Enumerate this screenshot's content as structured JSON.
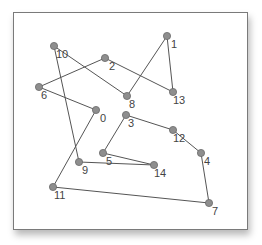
{
  "diagram": {
    "type": "graph-tour",
    "node_color": "#8e8e8e",
    "edge_color": "#555555",
    "label_color": "#444444",
    "nodes": [
      {
        "id": "0",
        "label": "0",
        "x": 96,
        "y": 110,
        "lx": 4,
        "ly": 12
      },
      {
        "id": "1",
        "label": "1",
        "x": 167,
        "y": 36,
        "lx": 4,
        "ly": 12
      },
      {
        "id": "2",
        "label": "2",
        "x": 105,
        "y": 58,
        "lx": 4,
        "ly": 12
      },
      {
        "id": "3",
        "label": "3",
        "x": 126,
        "y": 115,
        "lx": 2,
        "ly": 12
      },
      {
        "id": "4",
        "label": "4",
        "x": 201,
        "y": 153,
        "lx": 3,
        "ly": 12
      },
      {
        "id": "5",
        "label": "5",
        "x": 103,
        "y": 153,
        "lx": 3,
        "ly": 12
      },
      {
        "id": "6",
        "label": "6",
        "x": 39,
        "y": 87,
        "lx": 2,
        "ly": 12
      },
      {
        "id": "7",
        "label": "7",
        "x": 209,
        "y": 203,
        "lx": 3,
        "ly": 12
      },
      {
        "id": "8",
        "label": "8",
        "x": 127,
        "y": 96,
        "lx": 2,
        "ly": 12
      },
      {
        "id": "9",
        "label": "9",
        "x": 79,
        "y": 162,
        "lx": 3,
        "ly": 12
      },
      {
        "id": "10",
        "label": "10",
        "x": 54,
        "y": 46,
        "lx": 2,
        "ly": 12
      },
      {
        "id": "11",
        "label": "11",
        "x": 53,
        "y": 187,
        "lx": 1,
        "ly": 12
      },
      {
        "id": "12",
        "label": "12",
        "x": 173,
        "y": 130,
        "lx": 0,
        "ly": 12
      },
      {
        "id": "13",
        "label": "13",
        "x": 173,
        "y": 92,
        "lx": 0,
        "ly": 12
      },
      {
        "id": "14",
        "label": "14",
        "x": 154,
        "y": 165,
        "lx": 0,
        "ly": 12
      }
    ],
    "edges": [
      [
        "10",
        "8"
      ],
      [
        "8",
        "1"
      ],
      [
        "1",
        "13"
      ],
      [
        "13",
        "2"
      ],
      [
        "2",
        "6"
      ],
      [
        "6",
        "0"
      ],
      [
        "0",
        "11"
      ],
      [
        "11",
        "7"
      ],
      [
        "7",
        "4"
      ],
      [
        "4",
        "12"
      ],
      [
        "12",
        "3"
      ],
      [
        "3",
        "5"
      ],
      [
        "5",
        "14"
      ],
      [
        "14",
        "9"
      ],
      [
        "9",
        "10"
      ]
    ]
  }
}
